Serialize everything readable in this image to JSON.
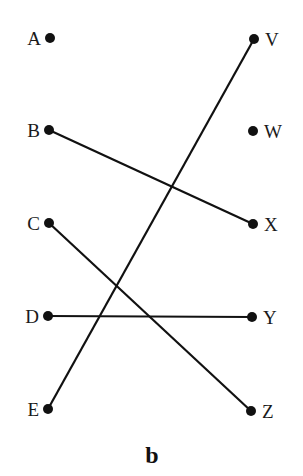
{
  "diagram": {
    "caption": "b",
    "colors": {
      "line": "#111111",
      "dot": "#111111",
      "text": "#1a1a1a"
    },
    "left_nodes": [
      {
        "id": "A",
        "label": "A",
        "x": 50,
        "y": 38
      },
      {
        "id": "B",
        "label": "B",
        "x": 49,
        "y": 130
      },
      {
        "id": "C",
        "label": "C",
        "x": 49,
        "y": 223
      },
      {
        "id": "D",
        "label": "D",
        "x": 48,
        "y": 316
      },
      {
        "id": "E",
        "label": "E",
        "x": 48,
        "y": 409
      }
    ],
    "right_nodes": [
      {
        "id": "V",
        "label": "V",
        "x": 254,
        "y": 39
      },
      {
        "id": "W",
        "label": "W",
        "x": 253,
        "y": 131
      },
      {
        "id": "X",
        "label": "X",
        "x": 253,
        "y": 224
      },
      {
        "id": "Y",
        "label": "Y",
        "x": 252,
        "y": 317
      },
      {
        "id": "Z",
        "label": "Z",
        "x": 251,
        "y": 411
      }
    ],
    "edges": [
      {
        "from": "B",
        "to": "X"
      },
      {
        "from": "C",
        "to": "Z"
      },
      {
        "from": "D",
        "to": "Y"
      },
      {
        "from": "E",
        "to": "V"
      }
    ]
  }
}
